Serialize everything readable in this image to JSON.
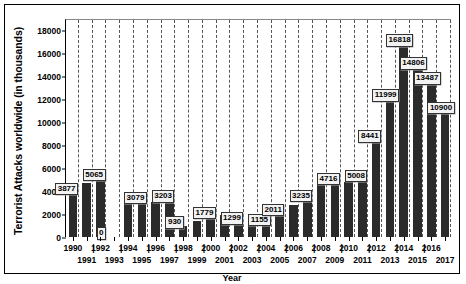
{
  "chart_data": {
    "type": "bar",
    "title": "",
    "xlabel": "Year",
    "ylabel": "Terrorist Attacks worldwide (in thousands)",
    "ylim": [
      0,
      19000
    ],
    "yticks": [
      0,
      2000,
      4000,
      6000,
      8000,
      10000,
      12000,
      14000,
      16000,
      18000
    ],
    "ytick_labels": [
      "0",
      "2000",
      "4000",
      "6000",
      "8000",
      "10000",
      "12000",
      "14000",
      "16000",
      "18000"
    ],
    "grid": "vertical-dashed",
    "legend": "none",
    "categories": [
      "1990",
      "1991",
      "1992",
      "1993",
      "1994",
      "1995",
      "1996",
      "1997",
      "1998",
      "1999",
      "2000",
      "2001",
      "2002",
      "2003",
      "2004",
      "2005",
      "2006",
      "2007",
      "2008",
      "2009",
      "2010",
      "2011",
      "2012",
      "2013",
      "2014",
      "2015",
      "2016",
      "2017"
    ],
    "values": [
      3877,
      4700,
      5065,
      0,
      3500,
      3079,
      3050,
      3203,
      930,
      1400,
      1779,
      1950,
      1299,
      1250,
      1155,
      2011,
      2800,
      3235,
      4800,
      4716,
      4800,
      5008,
      8441,
      11999,
      16818,
      14806,
      13487,
      10900
    ],
    "data_labels": [
      {
        "category": "1990",
        "text": "3877"
      },
      {
        "category": "1992",
        "text": "5065"
      },
      {
        "category": "1993",
        "text": "0"
      },
      {
        "category": "1995",
        "text": "3079"
      },
      {
        "category": "1997",
        "text": "3203"
      },
      {
        "category": "1998",
        "text": "930"
      },
      {
        "category": "2000",
        "text": "1779"
      },
      {
        "category": "2002",
        "text": "1299"
      },
      {
        "category": "2004",
        "text": "1155"
      },
      {
        "category": "2005",
        "text": "2011"
      },
      {
        "category": "2007",
        "text": "3235"
      },
      {
        "category": "2009",
        "text": "4716"
      },
      {
        "category": "2011",
        "text": "5008"
      },
      {
        "category": "2012",
        "text": "8441"
      },
      {
        "category": "2013",
        "text": "11999"
      },
      {
        "category": "2014",
        "text": "16818"
      },
      {
        "category": "2015",
        "text": "14806"
      },
      {
        "category": "2016",
        "text": "13487"
      },
      {
        "category": "2017",
        "text": "10900"
      }
    ],
    "bar_color": "#2b2b2b",
    "label_box_color": "#f2f2f2",
    "axis_color": "#000000",
    "gridline_color": "#555555"
  }
}
